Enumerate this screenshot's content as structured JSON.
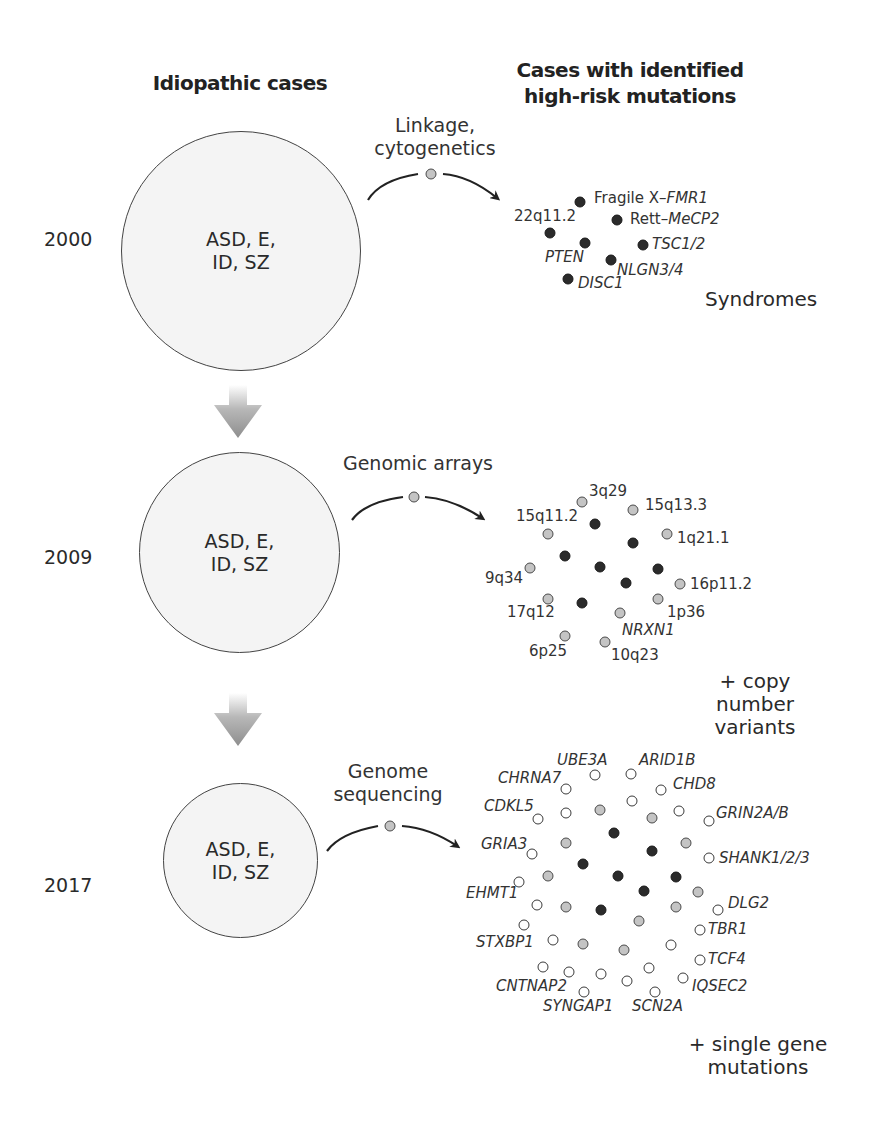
{
  "headers": {
    "left": "Idiopathic cases",
    "right": "Cases with identified\nhigh-risk mutations"
  },
  "circle_label": "ASD, E,\nID, SZ",
  "colors": {
    "circle_fill": "#f4f4f4",
    "circle_stroke": "#444444",
    "dot_black": "#2b2b2b",
    "dot_gray": "#c4c4c4",
    "dot_white": "#ffffff",
    "arrow_gray": "#9a9a9a"
  },
  "rows": [
    {
      "year": "2000",
      "method": "Linkage,\ncytogenetics",
      "footer": "Syndromes",
      "labels": [
        {
          "text_pre": "Fragile X–",
          "text_it": "FMR1"
        },
        {
          "text_pre": "Rett–",
          "text_it": "MeCP2"
        },
        {
          "text": "22q11.2",
          "italic": false
        },
        {
          "text": "TSC1/2",
          "italic": true
        },
        {
          "text": "PTEN",
          "italic": true
        },
        {
          "text": "NLGN3/4",
          "italic": true
        },
        {
          "text": "DISC1",
          "italic": true
        }
      ]
    },
    {
      "year": "2009",
      "method": "Genomic arrays",
      "footer": "+ copy number\nvariants",
      "labels": [
        {
          "text": "3q29",
          "italic": false
        },
        {
          "text": "15q13.3",
          "italic": false
        },
        {
          "text": "15q11.2",
          "italic": false
        },
        {
          "text": "1q21.1",
          "italic": false
        },
        {
          "text": "9q34",
          "italic": false
        },
        {
          "text": "16p11.2",
          "italic": false
        },
        {
          "text": "17q12",
          "italic": false
        },
        {
          "text": "1p36",
          "italic": false
        },
        {
          "text": "NRXN1",
          "italic": true
        },
        {
          "text": "6p25",
          "italic": false
        },
        {
          "text": "10q23",
          "italic": false
        }
      ]
    },
    {
      "year": "2017",
      "method": "Genome\nsequencing",
      "footer": "+ single gene\nmutations",
      "labels": [
        {
          "text": "UBE3A",
          "italic": true
        },
        {
          "text": "ARID1B",
          "italic": true
        },
        {
          "text": "CHRNA7",
          "italic": true
        },
        {
          "text": "CHD8",
          "italic": true
        },
        {
          "text": "CDKL5",
          "italic": true
        },
        {
          "text": "GRIN2A/B",
          "italic": true
        },
        {
          "text": "GRIA3",
          "italic": true
        },
        {
          "text": "SHANK1/2/3",
          "italic": true
        },
        {
          "text": "EHMT1",
          "italic": true
        },
        {
          "text": "DLG2",
          "italic": true
        },
        {
          "text": "TBR1",
          "italic": true
        },
        {
          "text": "STXBP1",
          "italic": true
        },
        {
          "text": "TCF4",
          "italic": true
        },
        {
          "text": "CNTNAP2",
          "italic": true
        },
        {
          "text": "IQSEC2",
          "italic": true
        },
        {
          "text": "SYNGAP1",
          "italic": true
        },
        {
          "text": "SCN2A",
          "italic": true
        }
      ]
    }
  ]
}
